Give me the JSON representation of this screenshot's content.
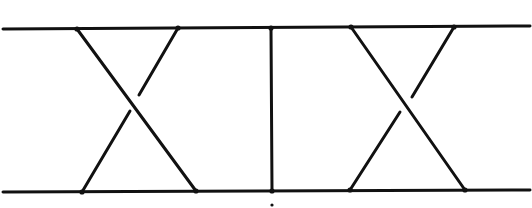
{
  "diagram": {
    "type": "braid-diagram",
    "colors": {
      "stroke": "#111111",
      "background": "#ffffff"
    },
    "horizontal_lines": [
      {
        "name": "top-line",
        "x1": 3,
        "y1": 29,
        "x2": 530,
        "y2": 26
      },
      {
        "name": "bottom-line",
        "x1": 3,
        "y1": 192,
        "x2": 530,
        "y2": 190
      }
    ],
    "crossings": [
      {
        "name": "left-crossing",
        "over": {
          "x1": 77,
          "y1": 29,
          "x2": 196,
          "y2": 191
        },
        "under_top": {
          "x1": 178,
          "y1": 28,
          "x2": 139,
          "y2": 95
        },
        "under_bottom": {
          "x1": 130,
          "y1": 111,
          "x2": 82,
          "y2": 192
        }
      },
      {
        "name": "right-crossing",
        "over": {
          "x1": 351,
          "y1": 27,
          "x2": 465,
          "y2": 190
        },
        "under_top": {
          "x1": 454,
          "y1": 27,
          "x2": 412,
          "y2": 97
        },
        "under_bottom": {
          "x1": 400,
          "y1": 112,
          "x2": 350,
          "y2": 190
        }
      }
    ],
    "vertical_strand": {
      "name": "middle-vertical",
      "x1": 271,
      "y1": 28,
      "x2": 272,
      "y2": 191
    },
    "nodes": [
      {
        "x": 77,
        "y": 29
      },
      {
        "x": 178,
        "y": 28
      },
      {
        "x": 271,
        "y": 28
      },
      {
        "x": 351,
        "y": 27
      },
      {
        "x": 454,
        "y": 27
      },
      {
        "x": 82,
        "y": 192
      },
      {
        "x": 196,
        "y": 191
      },
      {
        "x": 272,
        "y": 191
      },
      {
        "x": 350,
        "y": 190
      },
      {
        "x": 465,
        "y": 190
      }
    ],
    "bottom_mark": {
      "x": 272,
      "y": 205
    }
  }
}
